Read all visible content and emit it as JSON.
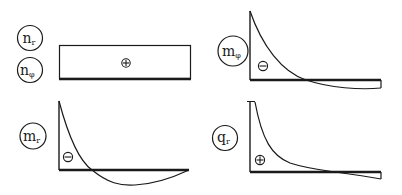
{
  "diagram": {
    "panels": [
      {
        "id": "n",
        "labels": [
          {
            "main": "n",
            "sub": "r"
          },
          {
            "main": "n",
            "sub": "φ"
          }
        ],
        "sign": "⊕",
        "shape": "constant-rectangle"
      },
      {
        "id": "m_phi",
        "labels": [
          {
            "main": "m",
            "sub": "φ"
          }
        ],
        "sign": "⊖",
        "shape": "decaying-curve-crossing-zero"
      },
      {
        "id": "m_r",
        "labels": [
          {
            "main": "m",
            "sub": "r"
          }
        ],
        "sign": "⊖",
        "shape": "decaying-curve-crossing-zero-with-sag"
      },
      {
        "id": "q_r",
        "labels": [
          {
            "main": "q",
            "sub": "r"
          }
        ],
        "sign": "⊕",
        "shape": "hyperbolic-decay-crossing-zero"
      }
    ],
    "colors": {
      "stroke": "#1a1a1a",
      "background": "#ffffff"
    }
  }
}
